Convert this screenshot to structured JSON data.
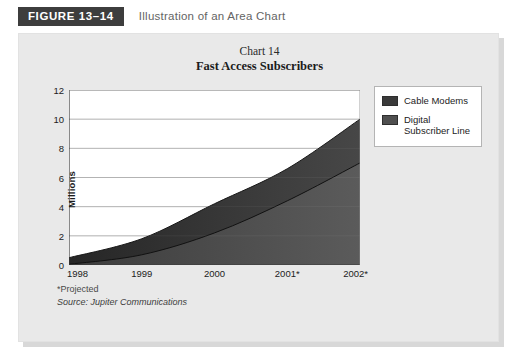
{
  "figure": {
    "badge_label": "FIGURE 13–14",
    "caption": "Illustration of an Area Chart"
  },
  "legend": {
    "position": "top-right",
    "items": [
      {
        "label": "Cable Modems",
        "color": "#3a3a3a"
      },
      {
        "label": "Digital Subscriber Line",
        "color": "#4f4f4f"
      }
    ]
  },
  "footnotes": {
    "projected": "*Projected",
    "source": "Source: Jupiter Communications"
  },
  "chart_data": {
    "type": "area",
    "stacked": true,
    "title": "Chart 14",
    "subtitle": "Fast Access Subscribers",
    "xlabel": "",
    "ylabel": "Millions",
    "categories": [
      "1998",
      "1999",
      "2000",
      "2001*",
      "2002*"
    ],
    "x_tick_labels": [
      "1998",
      "1999",
      "2000",
      "2001*",
      "2002*"
    ],
    "y_tick_labels": [
      "0",
      "2",
      "4",
      "6",
      "8",
      "10",
      "12"
    ],
    "y_ticks": [
      0,
      2,
      4,
      6,
      8,
      10,
      12
    ],
    "ylim": [
      0,
      12
    ],
    "grid": true,
    "grid_axis": "y",
    "series": [
      {
        "name": "Digital Subscriber Line",
        "color": "#4f4f4f",
        "values": [
          0.05,
          0.7,
          2.2,
          4.4,
          7.0
        ]
      },
      {
        "name": "Cable Modems",
        "color": "#3a3a3a",
        "values": [
          0.45,
          1.1,
          2.0,
          2.2,
          3.0
        ]
      }
    ],
    "cumulative_totals": [
      0.5,
      1.8,
      4.2,
      6.6,
      10.0
    ],
    "annotations": [
      "*Projected",
      "Source: Jupiter Communications"
    ]
  }
}
